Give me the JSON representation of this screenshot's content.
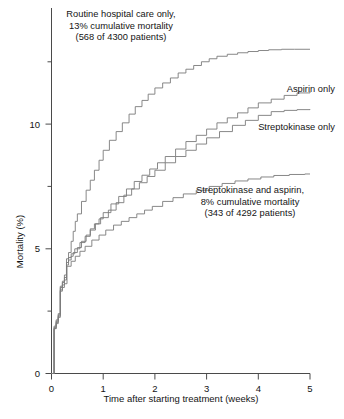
{
  "figure": {
    "title": "",
    "background": "#ffffff",
    "curve_color": "#7a7a7a",
    "axis_color": "#4a4a4a"
  },
  "axes": {
    "x_label": "Time after starting treatment (weeks)",
    "y_label": "Mortality (%)",
    "x_ticks": [
      "0",
      "1",
      "2",
      "3",
      "4",
      "5"
    ],
    "y_ticks": [
      "0",
      "5",
      "10"
    ],
    "x_range": [
      0,
      5
    ],
    "y_range": [
      0,
      14.2
    ],
    "grid": false
  },
  "annotations": {
    "routine": {
      "line1": "Routine hospital care only,",
      "line2": "13% cumulative mortality",
      "line3": "(568 of 4300 patients)"
    },
    "aspirin": {
      "line1": "Aspirin only"
    },
    "streptokinase": {
      "line1": "Streptokinase only"
    },
    "combination": {
      "line1": "Streptokinase and aspirin,",
      "line2": "8% cumulative mortality",
      "line3": "(343 of 4292 patients)"
    }
  },
  "chart_data": {
    "type": "line",
    "subtype": "kaplan-meier-step",
    "title": "",
    "xlabel": "Time after starting treatment (weeks)",
    "ylabel": "Mortality (%)",
    "xlim": [
      0,
      5
    ],
    "ylim": [
      0,
      14.2
    ],
    "x_ticks": [
      0,
      1,
      2,
      3,
      4,
      5
    ],
    "y_ticks": [
      0,
      5,
      10
    ],
    "y_minor_ticks": [
      2.5,
      7.5,
      12.5
    ],
    "grid": false,
    "legend_position": "inline-annotations",
    "series": [
      {
        "name": "Routine hospital care only",
        "final_value": 13.0,
        "n_events": 568,
        "n_total": 4300,
        "label": "13% cumulative mortality (568 of 4300 patients)",
        "x": [
          0.0,
          0.05,
          0.09,
          0.13,
          0.17,
          0.21,
          0.25,
          0.29,
          0.33,
          0.38,
          0.42,
          0.46,
          0.5,
          0.58,
          0.67,
          0.75,
          0.83,
          0.92,
          1.0,
          1.12,
          1.25,
          1.37,
          1.5,
          1.62,
          1.75,
          1.87,
          2.0,
          2.15,
          2.3,
          2.45,
          2.6,
          2.75,
          2.9,
          3.05,
          3.2,
          3.4,
          3.6,
          3.8,
          4.0,
          4.2,
          4.45,
          4.7,
          5.0
        ],
        "y": [
          0.0,
          1.85,
          2.1,
          2.35,
          3.45,
          3.7,
          3.95,
          4.6,
          4.85,
          5.3,
          5.7,
          6.1,
          6.4,
          6.9,
          7.35,
          7.75,
          8.15,
          8.55,
          8.95,
          9.35,
          9.7,
          10.05,
          10.4,
          10.7,
          10.95,
          11.2,
          11.45,
          11.65,
          11.85,
          12.05,
          12.2,
          12.35,
          12.5,
          12.62,
          12.72,
          12.8,
          12.86,
          12.91,
          12.95,
          12.98,
          13.0,
          13.0,
          13.0
        ]
      },
      {
        "name": "Aspirin only",
        "final_value": 11.3,
        "label": "Aspirin only",
        "x": [
          0.0,
          0.05,
          0.09,
          0.13,
          0.17,
          0.21,
          0.25,
          0.29,
          0.33,
          0.38,
          0.42,
          0.5,
          0.58,
          0.67,
          0.75,
          0.83,
          0.92,
          1.0,
          1.15,
          1.3,
          1.45,
          1.6,
          1.75,
          1.9,
          2.05,
          2.2,
          2.4,
          2.6,
          2.8,
          3.0,
          3.2,
          3.4,
          3.6,
          3.8,
          4.0,
          4.25,
          4.5,
          4.75,
          5.0
        ],
        "y": [
          0.0,
          1.8,
          2.05,
          2.3,
          3.35,
          3.55,
          3.75,
          4.35,
          4.55,
          4.7,
          4.85,
          5.05,
          5.3,
          5.55,
          5.8,
          6.0,
          6.2,
          6.45,
          6.8,
          7.1,
          7.4,
          7.7,
          7.95,
          8.2,
          8.45,
          8.7,
          9.0,
          9.3,
          9.55,
          9.8,
          10.05,
          10.25,
          10.45,
          10.65,
          10.85,
          11.0,
          11.15,
          11.25,
          11.3
        ]
      },
      {
        "name": "Streptokinase only",
        "final_value": 10.6,
        "label": "Streptokinase only",
        "x": [
          0.0,
          0.05,
          0.09,
          0.13,
          0.17,
          0.21,
          0.25,
          0.29,
          0.33,
          0.38,
          0.45,
          0.55,
          0.65,
          0.75,
          0.85,
          0.95,
          1.1,
          1.25,
          1.4,
          1.55,
          1.7,
          1.85,
          2.0,
          2.2,
          2.4,
          2.6,
          2.8,
          3.0,
          3.25,
          3.5,
          3.75,
          4.0,
          4.25,
          4.5,
          4.75,
          5.0
        ],
        "y": [
          0.0,
          1.9,
          2.15,
          2.4,
          3.5,
          3.65,
          3.85,
          4.45,
          4.65,
          4.8,
          5.0,
          5.25,
          5.5,
          5.75,
          6.0,
          6.25,
          6.55,
          6.85,
          7.15,
          7.4,
          7.65,
          7.9,
          8.15,
          8.45,
          8.7,
          8.95,
          9.2,
          9.45,
          9.7,
          9.95,
          10.15,
          10.35,
          10.5,
          10.55,
          10.58,
          10.6
        ]
      },
      {
        "name": "Streptokinase and aspirin",
        "final_value": 8.0,
        "n_events": 343,
        "n_total": 4292,
        "label": "8% cumulative mortality (343 of 4292 patients)",
        "x": [
          0.0,
          0.05,
          0.09,
          0.13,
          0.17,
          0.21,
          0.25,
          0.3,
          0.38,
          0.46,
          0.55,
          0.65,
          0.78,
          0.92,
          1.05,
          1.2,
          1.35,
          1.5,
          1.65,
          1.8,
          1.95,
          2.15,
          2.35,
          2.55,
          2.8,
          3.05,
          3.3,
          3.55,
          3.8,
          4.05,
          4.3,
          4.6,
          4.9,
          5.0
        ],
        "y": [
          0.0,
          1.8,
          2.0,
          2.25,
          3.3,
          3.45,
          3.6,
          4.3,
          4.5,
          4.7,
          4.9,
          5.1,
          5.35,
          5.55,
          5.75,
          5.95,
          6.1,
          6.25,
          6.4,
          6.55,
          6.7,
          6.9,
          7.05,
          7.2,
          7.35,
          7.5,
          7.62,
          7.72,
          7.8,
          7.88,
          7.94,
          7.98,
          8.0,
          8.0
        ]
      }
    ]
  }
}
